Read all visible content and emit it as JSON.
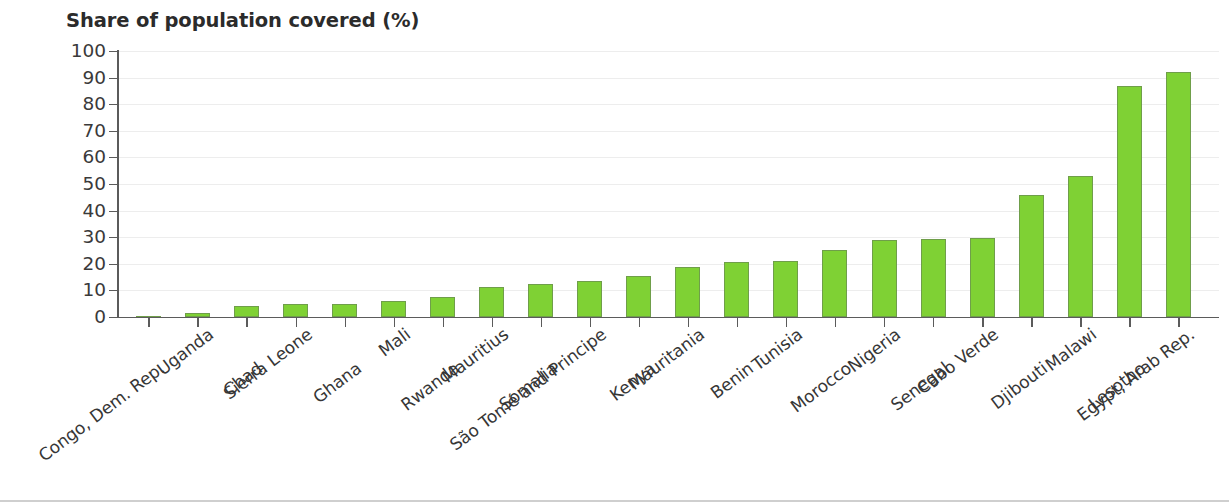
{
  "chart_data": {
    "type": "bar",
    "title": "Share of population covered (%)",
    "xlabel": "",
    "ylabel": "",
    "ylim": [
      0,
      100
    ],
    "yticks": [
      0,
      10,
      20,
      30,
      40,
      50,
      60,
      70,
      80,
      90,
      100
    ],
    "grid": true,
    "legend": false,
    "bar_color": "#7fd134",
    "bar_border_color": "#6f9e4a",
    "categories": [
      "Congo, Dem. Rep.",
      "Uganda",
      "Chad",
      "Sierra Leone",
      "Ghana",
      "Mali",
      "Rwanda",
      "Mauritius",
      "Somalia",
      "São Tomé and Principe",
      "Kenya",
      "Mauritania",
      "Benin",
      "Tunisia",
      "Morocco",
      "Nigeria",
      "Senegal",
      "Cabo Verde",
      "Djibouti",
      "Malawi",
      "Lesotho",
      "Egypt, Arab Rep."
    ],
    "values": [
      0.3,
      1.5,
      4.0,
      5.0,
      5.0,
      6.2,
      7.6,
      11.2,
      12.4,
      13.4,
      15.4,
      18.8,
      20.6,
      20.9,
      25.3,
      29.1,
      29.3,
      29.8,
      45.8,
      53.2,
      86.8,
      92.2
    ],
    "label_rows": [
      1,
      0,
      1,
      0,
      1,
      0,
      1,
      0,
      1,
      0,
      1,
      0,
      1,
      0,
      1,
      0,
      1,
      0,
      1,
      0,
      1,
      0
    ]
  }
}
